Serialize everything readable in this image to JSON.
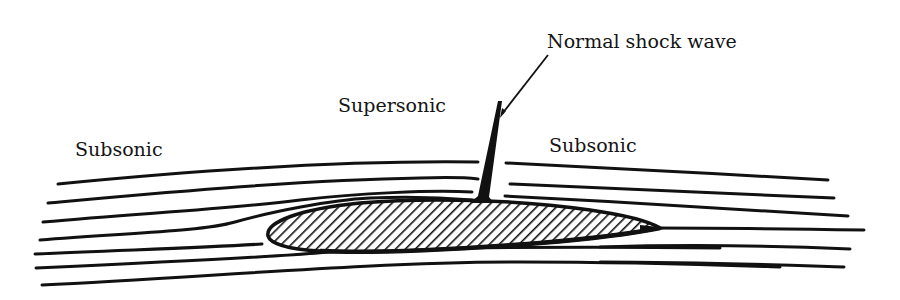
{
  "figure": {
    "labels": {
      "upstream": "Subsonic",
      "upper_surface": "Supersonic",
      "downstream": "Subsonic",
      "shock": "Normal shock wave"
    },
    "colors": {
      "ink": "#111111",
      "background": "#ffffff"
    }
  }
}
